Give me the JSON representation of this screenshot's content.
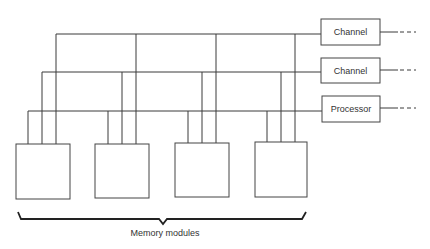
{
  "diagram": {
    "title": "",
    "units": [
      {
        "id": "ch1",
        "label": "Channel",
        "box": {
          "x": 321,
          "y": 19,
          "w": 59,
          "h": 26
        },
        "bus_y": 34
      },
      {
        "id": "ch2",
        "label": "Channel",
        "box": {
          "x": 321,
          "y": 58,
          "w": 59,
          "h": 25
        },
        "bus_y": 72
      },
      {
        "id": "proc",
        "label": "Processor",
        "box": {
          "x": 322,
          "y": 96,
          "w": 58,
          "h": 26
        },
        "bus_y": 111
      }
    ],
    "memory_modules": [
      {
        "id": "m1",
        "box": {
          "x": 16,
          "y": 144,
          "w": 54,
          "h": 55
        }
      },
      {
        "id": "m2",
        "box": {
          "x": 95,
          "y": 144,
          "w": 54,
          "h": 54
        }
      },
      {
        "id": "m3",
        "box": {
          "x": 175,
          "y": 143,
          "w": 54,
          "h": 54
        }
      },
      {
        "id": "m4",
        "box": {
          "x": 255,
          "y": 142,
          "w": 52,
          "h": 55
        }
      }
    ],
    "group_label": "Memory modules",
    "line_color": "#3a3a3a",
    "background": "#ffffff"
  }
}
